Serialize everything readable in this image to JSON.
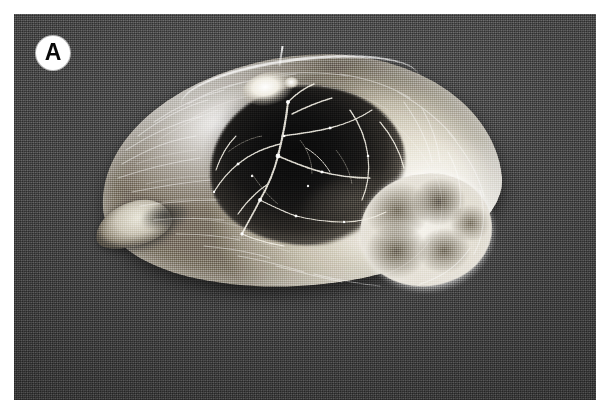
{
  "figure": {
    "panel_label": "A",
    "domain_note": "grayscale gross-pathology photograph",
    "caption": ""
  },
  "image": {
    "width": 601,
    "height": 415,
    "plate": {
      "x": 14,
      "y": 14,
      "width": 582,
      "height": 386
    },
    "background_description": "dark gray studio backdrop, halftone printed",
    "colors": {
      "page": "#ffffff",
      "backdrop_dark": "#383838",
      "backdrop_mid": "#4c4c4c",
      "backdrop_light": "#5d5d5d",
      "specimen_pale": "#f3f1ea",
      "specimen_mid": "#c9c4b6",
      "specimen_shadow": "#8d8679",
      "core_dark": "#0d0d0d",
      "core_edge": "#5d5850",
      "label_circle": "#ffffff",
      "label_text": "#0a0a0a"
    }
  },
  "specimen": {
    "name": "sectioned ovoid organ specimen",
    "shape": "bean-shaped / ovoid cut surface",
    "bounds": {
      "x": 78,
      "y": 30,
      "width": 410,
      "height": 250
    },
    "regions": [
      {
        "name": "central hemorrhagic necrotic core",
        "tone": "near-black",
        "bounds": {
          "x": 196,
          "y": 72,
          "width": 196,
          "height": 160
        }
      },
      {
        "name": "pale fibrous parenchyma rim",
        "tone": "bright white-cream",
        "bounds": {
          "x": 86,
          "y": 42,
          "width": 400,
          "height": 230
        }
      },
      {
        "name": "lobulated bright region lower-right",
        "tone": "white with gray lobules",
        "bounds": {
          "x": 346,
          "y": 160,
          "width": 132,
          "height": 112
        }
      },
      {
        "name": "protruding appendage lower-left",
        "tone": "pale with shadowed notch",
        "bounds": {
          "x": 80,
          "y": 188,
          "width": 78,
          "height": 44
        }
      },
      {
        "name": "bright hilar highlight upper-center",
        "tone": "specular white",
        "bounds": {
          "x": 228,
          "y": 58,
          "width": 56,
          "height": 34
        }
      },
      {
        "name": "thin filament at superior margin",
        "tone": "white thread",
        "bounds": {
          "x": 266,
          "y": 32,
          "width": 2,
          "height": 20
        }
      }
    ],
    "features": [
      "branching pale septa / vessels radiating across the dark core",
      "fine radial fibrous striations in the pale parenchyma",
      "bright capsular rim along the superior-left margin",
      "soft cast shadow beneath the specimen"
    ]
  }
}
